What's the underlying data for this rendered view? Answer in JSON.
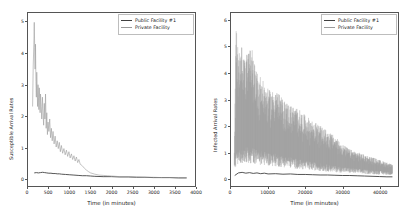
{
  "figure": {
    "background": "#ffffff",
    "panel_count": 2
  },
  "legend": {
    "entries": [
      {
        "label": "Public Facility #1",
        "color": "#404040"
      },
      {
        "label": "Private Facility",
        "color": "#9a9a9a"
      }
    ]
  },
  "chart_data": [
    {
      "type": "line",
      "panel": "left",
      "title": "",
      "xlabel": "Time (in minutes)",
      "ylabel": "Susceptible Arrival Rates",
      "xlim": [
        0,
        4000
      ],
      "ylim": [
        -0.25,
        5.3
      ],
      "xticks": [
        0,
        500,
        1000,
        1500,
        2000,
        2500,
        3000,
        3500,
        4000
      ],
      "xticklabels": [
        "0",
        "500",
        "1000",
        "1500",
        "2000",
        "2500",
        "3000",
        "3500",
        "4000"
      ],
      "yticks": [
        0,
        1,
        2,
        3,
        4,
        5
      ],
      "yticklabels": [
        "0",
        "1",
        "2",
        "3",
        "4",
        "5"
      ],
      "grid": false,
      "legend_position": "upper right",
      "series": [
        {
          "name": "Public Facility #1",
          "color": "#404040",
          "x": [
            150,
            200,
            250,
            300,
            350,
            400,
            450,
            500,
            550,
            600,
            650,
            700,
            750,
            800,
            900,
            1000,
            1100,
            1200,
            1300,
            1400,
            1500,
            1600,
            1800,
            2000,
            2200,
            2400,
            2600,
            2800,
            3000,
            3200,
            3400,
            3600,
            3800
          ],
          "y": [
            0.17,
            0.18,
            0.17,
            0.18,
            0.19,
            0.18,
            0.17,
            0.16,
            0.16,
            0.15,
            0.15,
            0.14,
            0.14,
            0.13,
            0.12,
            0.11,
            0.1,
            0.09,
            0.08,
            0.08,
            0.07,
            0.06,
            0.05,
            0.05,
            0.04,
            0.04,
            0.03,
            0.03,
            0.02,
            0.02,
            0.02,
            0.01,
            0.01
          ]
        },
        {
          "name": "Private Facility",
          "color": "#9a9a9a",
          "x": [
            110,
            125,
            140,
            150,
            160,
            170,
            180,
            190,
            200,
            210,
            220,
            230,
            240,
            250,
            260,
            270,
            280,
            290,
            300,
            315,
            330,
            345,
            360,
            375,
            390,
            405,
            420,
            435,
            450,
            465,
            480,
            500,
            520,
            540,
            560,
            580,
            600,
            625,
            650,
            675,
            700,
            725,
            750,
            775,
            800,
            830,
            860,
            890,
            920,
            950,
            980,
            1010,
            1040,
            1070,
            1100,
            1130,
            1160,
            1190,
            1220,
            1250,
            1300,
            1350,
            1400,
            1450,
            1500,
            1600,
            1700,
            1800,
            1900,
            2000,
            2200,
            2400,
            2600,
            2800,
            3000,
            3200,
            3400,
            3600,
            3800
          ],
          "y": [
            2.3,
            3.6,
            4.3,
            5.0,
            4.2,
            3.5,
            4.3,
            3.1,
            2.6,
            3.4,
            2.8,
            2.3,
            3.0,
            2.6,
            2.2,
            2.9,
            2.5,
            2.1,
            2.7,
            2.3,
            1.9,
            2.6,
            2.1,
            1.7,
            2.4,
            1.9,
            2.7,
            1.6,
            2.1,
            1.4,
            1.8,
            1.5,
            1.9,
            1.3,
            1.6,
            1.2,
            1.5,
            1.1,
            1.35,
            1.0,
            1.2,
            0.95,
            1.15,
            0.85,
            1.05,
            0.8,
            0.95,
            0.75,
            0.9,
            0.7,
            0.85,
            0.65,
            0.78,
            0.6,
            0.72,
            0.55,
            0.68,
            0.5,
            0.6,
            0.45,
            0.4,
            0.32,
            0.26,
            0.21,
            0.17,
            0.13,
            0.1,
            0.09,
            0.08,
            0.07,
            0.05,
            0.05,
            0.04,
            0.03,
            0.03,
            0.02,
            0.02,
            0.01,
            0.01
          ]
        }
      ]
    },
    {
      "type": "line",
      "panel": "right",
      "title": "",
      "xlabel": "Time (in minutes)",
      "ylabel": "Infected Arrival Rates",
      "xlim": [
        0,
        45000
      ],
      "ylim": [
        -0.3,
        6.3
      ],
      "xticks": [
        0,
        10000,
        20000,
        30000,
        40000
      ],
      "xticklabels": [
        "0",
        "10000",
        "20000",
        "30000",
        "40000"
      ],
      "yticks": [
        0,
        1,
        2,
        3,
        4,
        5,
        6
      ],
      "yticklabels": [
        "0",
        "1",
        "2",
        "3",
        "4",
        "5",
        "6"
      ],
      "grid": false,
      "legend_position": "upper right",
      "series": [
        {
          "name": "Public Facility #1",
          "color": "#404040",
          "x": [
            1000,
            2000,
            3000,
            4000,
            5000,
            6000,
            7000,
            8000,
            9000,
            10000,
            12000,
            14000,
            16000,
            18000,
            20000,
            22000,
            24000,
            26000,
            28000,
            30000,
            32000,
            34000,
            36000,
            38000,
            40000,
            42000,
            43500
          ],
          "y": [
            0.1,
            0.2,
            0.22,
            0.19,
            0.21,
            0.18,
            0.2,
            0.17,
            0.19,
            0.16,
            0.17,
            0.15,
            0.16,
            0.14,
            0.14,
            0.13,
            0.12,
            0.12,
            0.11,
            0.1,
            0.1,
            0.09,
            0.08,
            0.07,
            0.06,
            0.05,
            0.05
          ]
        },
        {
          "name": "Private Facility",
          "color": "#9a9a9a",
          "envelope_upper_x": [
            900,
            1400,
            2000,
            2600,
            3200,
            3800,
            4400,
            5000,
            5600,
            6400,
            7200,
            8000,
            9000,
            10000,
            11000,
            12000,
            13000,
            14000,
            15000,
            16000,
            17000,
            18000,
            19000,
            20000,
            21000,
            22000,
            23000,
            24000,
            25000,
            26000,
            27000,
            28000,
            29000,
            30000,
            31000,
            32000,
            33000,
            34000,
            35000,
            36000,
            37000,
            38000,
            39000,
            40000,
            41000,
            42000,
            43000,
            43500
          ],
          "envelope_upper_y": [
            1.2,
            6.0,
            4.7,
            5.0,
            5.0,
            4.3,
            5.0,
            4.9,
            5.0,
            4.3,
            4.0,
            3.9,
            3.6,
            3.4,
            3.3,
            3.5,
            3.2,
            3.0,
            2.9,
            2.8,
            2.7,
            2.7,
            2.5,
            2.4,
            2.3,
            2.2,
            2.1,
            2.0,
            1.9,
            1.8,
            1.7,
            1.6,
            1.45,
            1.3,
            1.2,
            1.1,
            1.05,
            1.0,
            0.95,
            0.9,
            0.85,
            0.8,
            0.75,
            0.7,
            0.65,
            0.6,
            0.55,
            0.5
          ],
          "envelope_lower_x": [
            900,
            1400,
            2000,
            3000,
            4000,
            6000,
            8000,
            10000,
            13000,
            16000,
            20000,
            24000,
            28000,
            32000,
            36000,
            40000,
            43500
          ],
          "envelope_lower_y": [
            0.6,
            1.0,
            1.1,
            1.2,
            1.25,
            1.2,
            1.1,
            1.05,
            0.95,
            0.85,
            0.7,
            0.6,
            0.5,
            0.42,
            0.35,
            0.3,
            0.25
          ],
          "peak_value": 6.0,
          "peak_x": 1400
        }
      ]
    }
  ]
}
